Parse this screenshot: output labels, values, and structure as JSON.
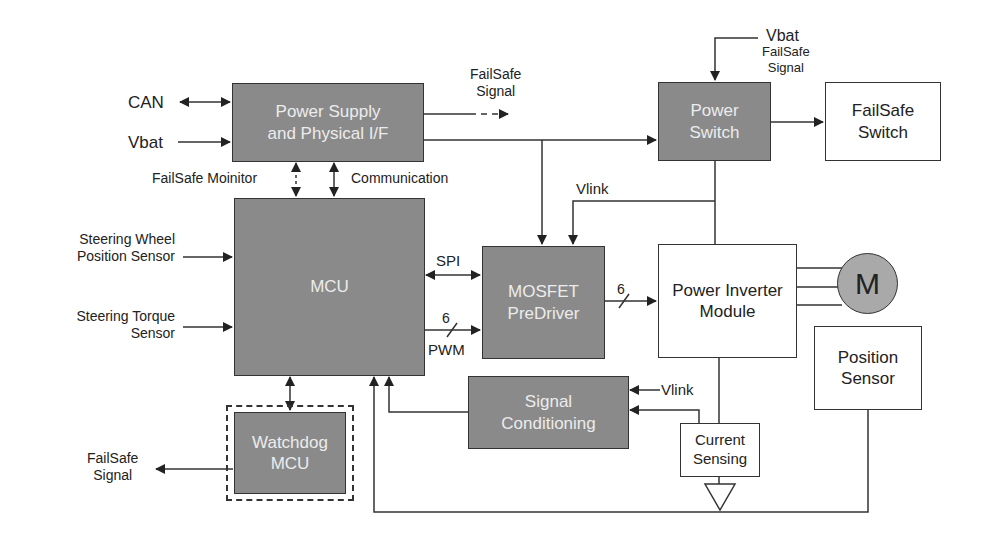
{
  "diagram": {
    "type": "block-diagram",
    "colors": {
      "dark_block": "#8a8a8a",
      "dark_block_text": "#ececec",
      "light_block": "#ffffff",
      "line": "#333333",
      "motor": "#a9a9a9"
    }
  },
  "blocks": {
    "power_supply": "Power Supply\nand Physical I/F",
    "mcu": "MCU",
    "watchdog": "Watchdog\nMCU",
    "mosfet": "MOSFET\nPreDriver",
    "signal_conditioning": "Signal\nConditioning",
    "power_switch": "Power\nSwitch",
    "failsafe_switch": "FailSafe\nSwitch",
    "power_inverter": "Power Inverter\nModule",
    "motor": "M",
    "position_sensor": "Position\nSensor",
    "current_sensing": "Current\nSensing"
  },
  "labels": {
    "can": "CAN",
    "vbat_left": "Vbat",
    "failsafe_signal_top": "FailSafe\nSignal",
    "failsafe_monitor": "FailSafe Moinitor",
    "communication": "Communication",
    "steering_wheel": "Steering Wheel\nPosition Sensor",
    "steering_torque": "Steering Torque\nSensor",
    "spi": "SPI",
    "pwm_count": "6",
    "pwm": "PWM",
    "inverter_count": "6",
    "vlink_top": "Vlink",
    "vlink_bottom": "Vlink",
    "vbat_top": "Vbat",
    "failsafe_signal_right": "FailSafe\nSignal",
    "failsafe_signal_bottom": "FailSafe\nSignal"
  }
}
